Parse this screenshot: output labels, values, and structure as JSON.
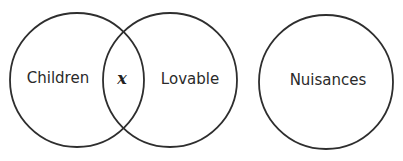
{
  "diagram": {
    "type": "venn",
    "sets": [
      {
        "label": "Children",
        "cx": 77,
        "cy": 80,
        "r": 67,
        "label_x": 58,
        "label_y": 78
      },
      {
        "label": "Lovable",
        "cx": 170,
        "cy": 80,
        "r": 67,
        "label_x": 190,
        "label_y": 79
      },
      {
        "label": "Nuisances",
        "cx": 326,
        "cy": 82,
        "r": 67,
        "label_x": 328,
        "label_y": 80
      }
    ],
    "intersection": {
      "between": [
        "Children",
        "Lovable"
      ],
      "element_label": "x",
      "label_x": 122,
      "label_y": 78
    },
    "colors": {
      "stroke": "#2e2e2e",
      "text": "#2a2a2a",
      "background": "#ffffff"
    }
  }
}
